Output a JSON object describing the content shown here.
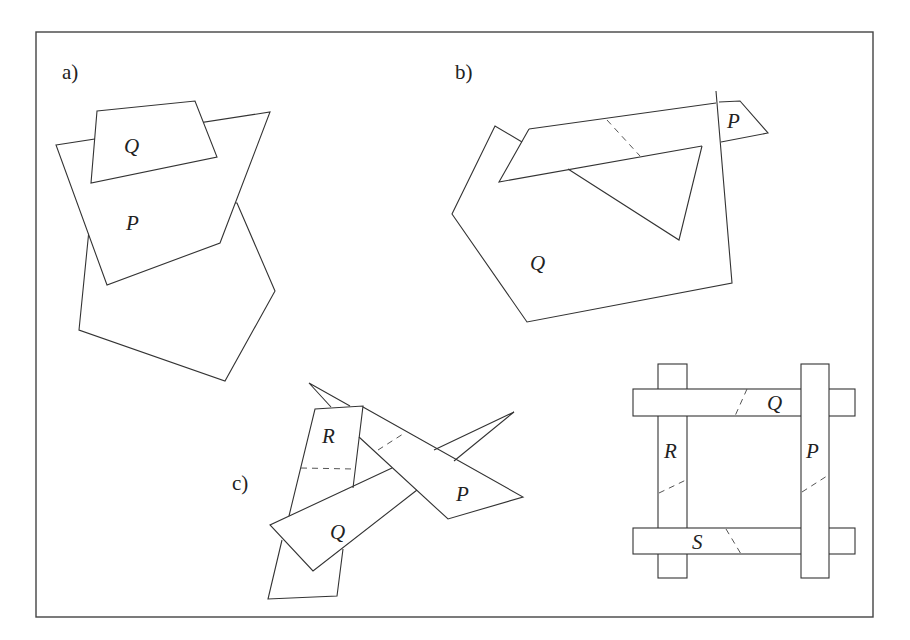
{
  "figure": {
    "panels": [
      {
        "id": "a",
        "label": "a)",
        "shapes": [
          {
            "name": "Q",
            "label": "Q"
          },
          {
            "name": "P",
            "label": "P"
          },
          {
            "name": "pentagon",
            "label": ""
          }
        ]
      },
      {
        "id": "b",
        "label": "b)",
        "shapes": [
          {
            "name": "P",
            "label": "P"
          },
          {
            "name": "Q",
            "label": "Q"
          }
        ]
      },
      {
        "id": "c",
        "label": "c)",
        "shapes": [
          {
            "name": "R",
            "label": "R"
          },
          {
            "name": "Q",
            "label": "Q"
          },
          {
            "name": "P",
            "label": "P"
          }
        ]
      },
      {
        "id": "d",
        "label": "",
        "shapes": [
          {
            "name": "Q",
            "label": "Q"
          },
          {
            "name": "R",
            "label": "R"
          },
          {
            "name": "P",
            "label": "P"
          },
          {
            "name": "S",
            "label": "S"
          }
        ]
      }
    ]
  },
  "colors": {
    "stroke": "#333333",
    "background": "#ffffff",
    "frame": "#444444"
  }
}
